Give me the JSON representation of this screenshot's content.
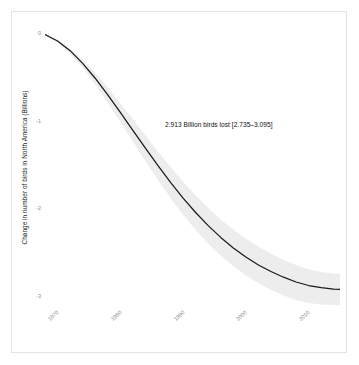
{
  "figure": {
    "background_color": "#ffffff",
    "frame_color": "#e2e2e2"
  },
  "annotation": {
    "text": "2.913 Billion birds lost [2.735–3.095]"
  },
  "axes": {
    "ylabel": "Change in number of birds in North America (Billions)",
    "xlabel": "",
    "ytick_labels": [
      "0",
      "-1",
      "-2",
      "-3"
    ],
    "xtick_labels": [
      "1970",
      "1980",
      "1990",
      "2000",
      "2010"
    ]
  },
  "chart_data": {
    "type": "line",
    "title": "",
    "xlabel": "",
    "ylabel": "Change in number of birds in North America (Billions)",
    "xlim": [
      1970,
      2017
    ],
    "ylim": [
      -3.15,
      0.12
    ],
    "xticks": [
      1970,
      1980,
      1990,
      2000,
      2010
    ],
    "yticks": [
      0,
      -1,
      -2,
      -3
    ],
    "grid": false,
    "legend": null,
    "line_color": "#1a1a1a",
    "band_color": "#d9d9d9",
    "annotations": [
      {
        "text": "2.913 Billion birds lost [2.735–3.095]",
        "x": 1993,
        "y": -1.06
      }
    ],
    "x": [
      1970,
      1972,
      1974,
      1976,
      1978,
      1980,
      1982,
      1984,
      1986,
      1988,
      1990,
      1992,
      1994,
      1996,
      1998,
      2000,
      2002,
      2004,
      2006,
      2008,
      2010,
      2012,
      2014,
      2016,
      2017
    ],
    "series": [
      {
        "name": "Cumulative change in bird abundance",
        "values": [
          0.0,
          -0.075,
          -0.185,
          -0.33,
          -0.5,
          -0.69,
          -0.89,
          -1.095,
          -1.3,
          -1.5,
          -1.69,
          -1.87,
          -2.035,
          -2.185,
          -2.32,
          -2.44,
          -2.545,
          -2.635,
          -2.71,
          -2.775,
          -2.83,
          -2.87,
          -2.895,
          -2.91,
          -2.913
        ],
        "lower": [
          0.0,
          -0.09,
          -0.215,
          -0.38,
          -0.57,
          -0.78,
          -1.0,
          -1.225,
          -1.45,
          -1.665,
          -1.87,
          -2.06,
          -2.235,
          -2.39,
          -2.53,
          -2.65,
          -2.755,
          -2.845,
          -2.92,
          -2.985,
          -3.035,
          -3.07,
          -3.088,
          -3.094,
          -3.095
        ],
        "upper": [
          0.0,
          -0.062,
          -0.158,
          -0.285,
          -0.435,
          -0.605,
          -0.785,
          -0.97,
          -1.155,
          -1.34,
          -1.515,
          -1.685,
          -1.84,
          -1.985,
          -2.115,
          -2.23,
          -2.335,
          -2.425,
          -2.505,
          -2.575,
          -2.635,
          -2.685,
          -2.715,
          -2.732,
          -2.735
        ]
      }
    ]
  }
}
